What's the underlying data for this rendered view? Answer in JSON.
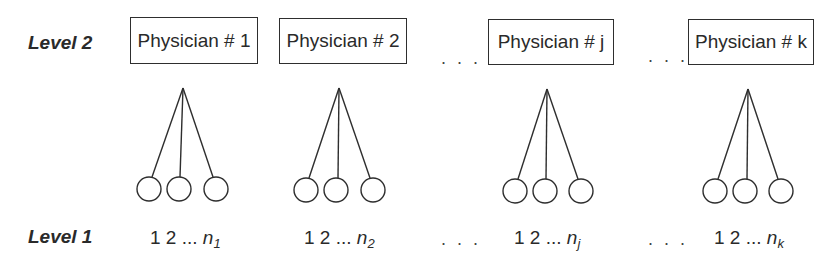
{
  "diagram": {
    "type": "multilevel-hierarchy",
    "levels": {
      "level2": "Level 2",
      "level1": "Level 1"
    },
    "physicians": [
      {
        "label": "Physician # 1",
        "index": "1",
        "units_prefix": "1 2 ... ",
        "units_n": "n",
        "units_sub": "1"
      },
      {
        "label": "Physician # 2",
        "index": "2",
        "units_prefix": "1 2 ... ",
        "units_n": "n",
        "units_sub": "2"
      },
      {
        "label": "Physician # j",
        "index": "j",
        "units_prefix": "1 2 ... ",
        "units_n": "n",
        "units_sub": "j"
      },
      {
        "label": "Physician # k",
        "index": "k",
        "units_prefix": "1 2 ... ",
        "units_n": "n",
        "units_sub": "k"
      }
    ],
    "ellipsis": ". . .",
    "colors": {
      "stroke": "#2e2e2e",
      "text": "#2a2a2a",
      "background": "#ffffff"
    }
  }
}
